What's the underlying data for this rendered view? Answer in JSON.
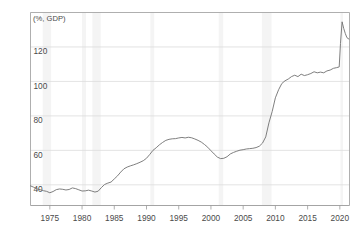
{
  "chart_data": {
    "type": "line",
    "title": "",
    "subtitle": "",
    "xlabel": "",
    "ylabel": "",
    "unit_label": "(%, GDP)",
    "xlim": [
      1972.0,
      2021.5
    ],
    "ylim": [
      28,
      140
    ],
    "grid": true,
    "grid_axis": "y",
    "legend": false,
    "legend_position": "none",
    "line_color": "#707070",
    "grid_color": "#dcdcdc",
    "axis_color": "#9a9a9a",
    "shading_color": "#f4f4f4",
    "xticks": [
      1975,
      1980,
      1985,
      1990,
      1995,
      2000,
      2005,
      2010,
      2015,
      2020
    ],
    "xtick_labels": [
      "1975",
      "1980",
      "1985",
      "1990",
      "1995",
      "2000",
      "2005",
      "2010",
      "2015",
      "2020"
    ],
    "yticks": [
      40,
      60,
      80,
      100,
      120
    ],
    "ytick_labels": [
      "40",
      "60",
      "80",
      "100",
      "120"
    ],
    "shaded_bands": [
      {
        "start": 1973.9,
        "end": 1975.2
      },
      {
        "start": 1980.0,
        "end": 1980.6
      },
      {
        "start": 1981.6,
        "end": 1982.9
      },
      {
        "start": 1990.6,
        "end": 1991.2
      },
      {
        "start": 2001.2,
        "end": 2001.9
      },
      {
        "start": 2007.9,
        "end": 2009.4
      },
      {
        "start": 2020.1,
        "end": 2020.5
      }
    ],
    "x": [
      1972.0,
      1972.5,
      1973.0,
      1973.5,
      1974.0,
      1974.5,
      1975.0,
      1975.5,
      1976.0,
      1976.5,
      1977.0,
      1977.5,
      1978.0,
      1978.5,
      1979.0,
      1979.5,
      1980.0,
      1980.5,
      1981.0,
      1981.5,
      1982.0,
      1982.5,
      1983.0,
      1983.5,
      1984.0,
      1984.5,
      1985.0,
      1985.5,
      1986.0,
      1986.5,
      1987.0,
      1987.5,
      1988.0,
      1988.5,
      1989.0,
      1989.5,
      1990.0,
      1990.5,
      1991.0,
      1991.5,
      1992.0,
      1992.5,
      1993.0,
      1993.5,
      1994.0,
      1994.5,
      1995.0,
      1995.5,
      1996.0,
      1996.5,
      1997.0,
      1997.5,
      1998.0,
      1998.5,
      1999.0,
      1999.5,
      2000.0,
      2000.5,
      2001.0,
      2001.5,
      2002.0,
      2002.5,
      2003.0,
      2003.5,
      2004.0,
      2004.5,
      2005.0,
      2005.5,
      2006.0,
      2006.5,
      2007.0,
      2007.5,
      2008.0,
      2008.5,
      2009.0,
      2009.5,
      2010.0,
      2010.5,
      2011.0,
      2011.5,
      2012.0,
      2012.5,
      2013.0,
      2013.5,
      2014.0,
      2014.5,
      2015.0,
      2015.5,
      2016.0,
      2016.5,
      2017.0,
      2017.5,
      2018.0,
      2018.5,
      2019.0,
      2019.5,
      2019.9,
      2020.1,
      2020.35,
      2020.6,
      2020.85,
      2021.1,
      2021.4
    ],
    "values": [
      39.4,
      38.6,
      37.6,
      37.2,
      36.6,
      36.2,
      35.4,
      36.1,
      37.2,
      37.6,
      37.4,
      37.0,
      37.3,
      38.2,
      37.8,
      37.1,
      36.4,
      36.5,
      36.9,
      36.4,
      35.8,
      36.3,
      38.4,
      40.2,
      41.0,
      41.6,
      43.4,
      45.2,
      47.4,
      49.3,
      50.3,
      51.0,
      51.6,
      52.3,
      53.1,
      54.0,
      55.4,
      57.6,
      60.0,
      61.5,
      63.2,
      64.6,
      65.8,
      66.4,
      66.7,
      66.8,
      67.2,
      67.5,
      67.2,
      67.6,
      67.3,
      66.6,
      65.8,
      64.8,
      63.4,
      61.8,
      59.8,
      57.9,
      56.1,
      55.2,
      55.4,
      56.3,
      57.9,
      58.8,
      59.5,
      60.1,
      60.4,
      60.8,
      61.0,
      61.2,
      61.6,
      62.4,
      64.2,
      67.8,
      76.0,
      82.5,
      90.5,
      95.2,
      98.8,
      100.4,
      101.4,
      102.8,
      103.6,
      102.8,
      104.2,
      103.4,
      103.9,
      104.6,
      105.6,
      105.0,
      105.4,
      105.0,
      106.1,
      106.6,
      107.6,
      108.0,
      108.4,
      122.0,
      134.6,
      130.8,
      127.8,
      125.4,
      124.6
    ]
  }
}
